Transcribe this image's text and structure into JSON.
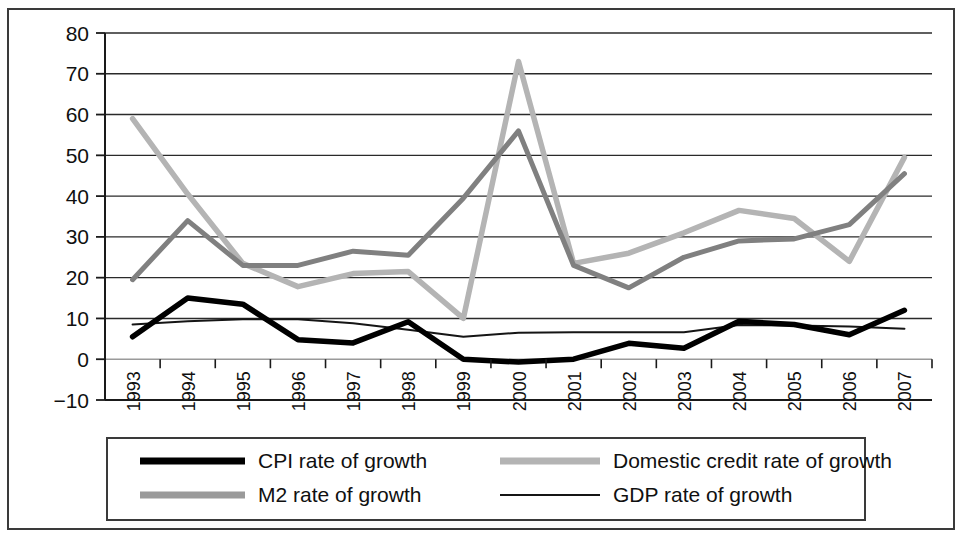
{
  "chart_data": {
    "type": "line",
    "title": "",
    "subtitle": "",
    "xlabel": "",
    "ylabel": "",
    "grid": true,
    "legend_position": "bottom",
    "ylim": [
      -10,
      80
    ],
    "yticks": [
      -10,
      0,
      10,
      20,
      30,
      40,
      50,
      60,
      70,
      80
    ],
    "ytick_labels": [
      "−10",
      "0",
      "10",
      "20",
      "30",
      "40",
      "50",
      "60",
      "70",
      "80"
    ],
    "categories": [
      1993,
      1994,
      1995,
      1996,
      1997,
      1998,
      1999,
      2000,
      2001,
      2002,
      2003,
      2004,
      2005,
      2006,
      2007
    ],
    "xtick_labels": [
      "1993",
      "1994",
      "1995",
      "1996",
      "1997",
      "1998",
      "1999",
      "2000",
      "2001",
      "2002",
      "2003",
      "2004",
      "2005",
      "2006",
      "2007"
    ],
    "series": [
      {
        "name": "CPI rate of growth",
        "color": "#000000",
        "width": 5.5,
        "values": [
          5.5,
          15.0,
          13.5,
          4.8,
          4.0,
          9.2,
          0.0,
          -0.7,
          0.0,
          3.9,
          2.7,
          9.3,
          8.5,
          6.0,
          12.0
        ]
      },
      {
        "name": "M2 rate of growth",
        "color": "#808080",
        "width": 5.0,
        "values": [
          19.5,
          34.0,
          23.0,
          23.0,
          26.5,
          25.5,
          39.5,
          56.0,
          23.0,
          17.5,
          25.0,
          29.0,
          29.5,
          33.0,
          45.5
        ]
      },
      {
        "name": "Domestic credit rate of growth",
        "color": "#b4b4b4",
        "width": 5.5,
        "values": [
          59.0,
          40.5,
          23.5,
          17.8,
          21.0,
          21.5,
          10.0,
          73.0,
          23.5,
          26.0,
          31.0,
          36.5,
          34.5,
          24.0,
          49.5
        ]
      },
      {
        "name": "GDP rate of growth",
        "color": "#151515",
        "width": 2.0,
        "values": [
          8.5,
          9.3,
          9.8,
          9.8,
          8.8,
          7.2,
          5.5,
          6.5,
          6.6,
          6.6,
          6.6,
          8.4,
          8.3,
          8.0,
          7.5
        ]
      }
    ],
    "legend": [
      {
        "label": "CPI rate of growth",
        "swatch": "thick-black-line",
        "color": "#000000"
      },
      {
        "label": "Domestic credit rate of growth",
        "swatch": "thick-light-gray-line",
        "color": "#b4b4b4"
      },
      {
        "label": "M2 rate of growth",
        "swatch": "thick-medium-gray-line",
        "color": "#9a9a9a"
      },
      {
        "label": "GDP rate of growth",
        "swatch": "thin-black-line",
        "color": "#151515"
      }
    ]
  }
}
